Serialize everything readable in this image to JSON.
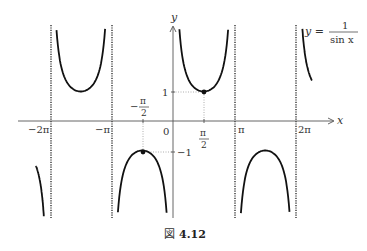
{
  "chart_data": {
    "type": "line",
    "function": "1/sin(x)",
    "xlabel": "x",
    "ylabel": "y",
    "xlim": [
      -7.0,
      7.5
    ],
    "ylim": [
      -3.3,
      3.3
    ],
    "x_ticks": [
      "-2π",
      "-π",
      "-π/2",
      "0",
      "π/2",
      "π",
      "2π"
    ],
    "x_tick_values": [
      -6.2832,
      -3.1416,
      -1.5708,
      0,
      1.5708,
      3.1416,
      6.2832
    ],
    "y_ticks": [
      "1",
      "-1"
    ],
    "y_tick_values": [
      1,
      -1
    ],
    "asymptotes": [
      -6.2832,
      -3.1416,
      3.1416,
      6.2832
    ],
    "marked_points": [
      {
        "x": 1.5708,
        "y": 1,
        "label": "(π/2, 1)"
      },
      {
        "x": -1.5708,
        "y": -1,
        "label": "(-π/2, -1)"
      }
    ],
    "branches": [
      {
        "x_range": [
          -7.0,
          -6.33
        ],
        "sign": "negative"
      },
      {
        "x_range": [
          -6.13,
          -3.29
        ],
        "sign": "positive",
        "min": {
          "x": -4.7124,
          "y": 1
        }
      },
      {
        "x_range": [
          -2.99,
          -0.15
        ],
        "sign": "negative",
        "max": {
          "x": -1.5708,
          "y": -1
        }
      },
      {
        "x_range": [
          0.15,
          2.99
        ],
        "sign": "positive",
        "min": {
          "x": 1.5708,
          "y": 1
        }
      },
      {
        "x_range": [
          3.29,
          6.13
        ],
        "sign": "negative",
        "max": {
          "x": 4.7124,
          "y": -1
        }
      },
      {
        "x_range": [
          6.33,
          7.1
        ],
        "sign": "positive"
      }
    ],
    "grid": false,
    "legend": null
  },
  "labels": {
    "y_axis": "y",
    "x_axis": "x",
    "origin": "0",
    "neg_two_pi": "−2π",
    "neg_pi": "−π",
    "pi": "π",
    "two_pi": "2π",
    "one": "1",
    "neg_one": "−1",
    "half_pi_num": "π",
    "half_pi_den": "2",
    "neg_half_pi_minus": "−",
    "neg_half_pi_num": "π",
    "neg_half_pi_den": "2",
    "eq_lhs": "y =",
    "eq_num": "1",
    "eq_den": "sin x"
  },
  "caption": {
    "prefix": "図",
    "number": "4.12"
  }
}
